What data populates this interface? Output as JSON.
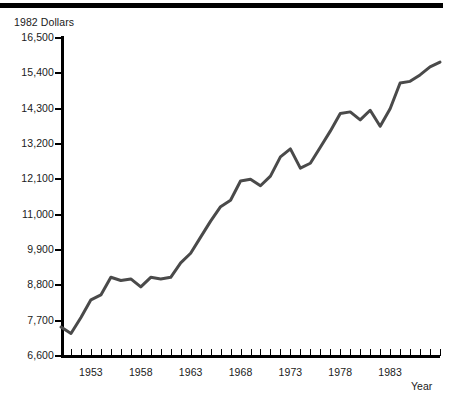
{
  "header": {
    "rule": "top-black-rule"
  },
  "axes": {
    "y_title": "1982 Dollars",
    "x_title": "Year",
    "y_ticks": [
      "16,500",
      "15,400",
      "14,300",
      "13,200",
      "12,100",
      "11,000",
      "9,900",
      "8,800",
      "7,700",
      "6,600"
    ],
    "x_ticks": [
      "1953",
      "1958",
      "1963",
      "1968",
      "1973",
      "1978",
      "1983"
    ]
  },
  "colors": {
    "line": "#4a4a4a",
    "axis": "#000000",
    "text": "#1a1a1a",
    "background": "#ffffff"
  },
  "chart_data": {
    "type": "line",
    "title": "",
    "xlabel": "Year",
    "ylabel": "1982 Dollars",
    "ylim": [
      6600,
      16500
    ],
    "xlim": [
      1950,
      1988
    ],
    "grid": false,
    "legend": "none",
    "y_tick_values": [
      16500,
      15400,
      14300,
      13200,
      12100,
      11000,
      9900,
      8800,
      7700,
      6600
    ],
    "x_tick_values": [
      1953,
      1958,
      1963,
      1968,
      1973,
      1978,
      1983
    ],
    "series": [
      {
        "name": "Real income per capita",
        "x": [
          1950,
          1951,
          1952,
          1953,
          1954,
          1955,
          1956,
          1957,
          1958,
          1959,
          1960,
          1961,
          1962,
          1963,
          1964,
          1965,
          1966,
          1967,
          1968,
          1969,
          1970,
          1971,
          1972,
          1973,
          1974,
          1975,
          1976,
          1977,
          1978,
          1979,
          1980,
          1981,
          1982,
          1983,
          1984,
          1985,
          1986,
          1987,
          1988
        ],
        "y": [
          7500,
          7300,
          7800,
          8350,
          8500,
          9050,
          8950,
          9000,
          8750,
          9050,
          9000,
          9050,
          9500,
          9800,
          10300,
          10800,
          11250,
          11450,
          12050,
          12100,
          11900,
          12200,
          12800,
          13050,
          12450,
          12600,
          13100,
          13600,
          14150,
          14200,
          13950,
          14250,
          13750,
          14300,
          15100,
          15150,
          15350,
          15600,
          15750
        ]
      }
    ]
  }
}
